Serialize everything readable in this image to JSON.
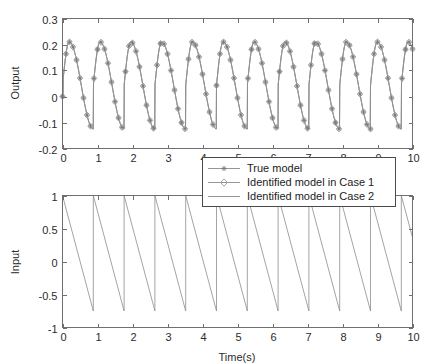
{
  "figure": {
    "background": "#ffffff",
    "axis_color": "#6f6f6f",
    "line_color": "#8a8a8a"
  },
  "legend": {
    "position": "between-axes-center",
    "items": [
      {
        "label": "True model",
        "marker": "asterisk-marker",
        "color": "#8a8a8a"
      },
      {
        "label": "Identified model in Case 1",
        "marker": "diamond-marker",
        "color": "#9d9d9d"
      },
      {
        "label": "Identified model in Case 2",
        "marker": "line-only",
        "color": "#8a8a8a"
      }
    ]
  },
  "chart_data": [
    {
      "type": "line",
      "id": "output-plot",
      "title": "",
      "xlabel": "",
      "ylabel": "Output",
      "xlim": [
        0,
        10
      ],
      "ylim": [
        -0.2,
        0.3
      ],
      "xticks": [
        0,
        1,
        2,
        3,
        4,
        5,
        6,
        7,
        8,
        9,
        10
      ],
      "xticklabels": [
        "0",
        "1",
        "2",
        "3",
        "4",
        "5",
        "6",
        "7",
        "8",
        "9",
        "10"
      ],
      "yticks": [
        -0.2,
        -0.1,
        0,
        0.1,
        0.2,
        0.3
      ],
      "yticklabels": [
        "-0.2",
        "-0.1",
        "0",
        "0.1",
        "0.2",
        "0.3"
      ],
      "grid": false,
      "legend_position": "outside-below-center",
      "waveform": {
        "shape": "periodic-sawtooth-response",
        "period": 0.88,
        "peak": 0.21,
        "trough": -0.125,
        "sample_interval": 0.1,
        "description": "Periodic output response to sawtooth input; rises to about 0.21 then falls to about -0.125 each cycle"
      },
      "series": [
        {
          "name": "True model",
          "marker": "asterisk-marker",
          "color": "#8a8a8a"
        },
        {
          "name": "Identified model in Case 1",
          "marker": "diamond-marker",
          "color": "#9d9d9d"
        },
        {
          "name": "Identified model in Case 2",
          "marker": "line-only",
          "color": "#8a8a8a"
        }
      ]
    },
    {
      "type": "line",
      "id": "input-plot",
      "title": "",
      "xlabel": "Time(s)",
      "ylabel": "Input",
      "xlim": [
        0,
        10
      ],
      "ylim": [
        -1,
        1
      ],
      "xticks": [
        0,
        1,
        2,
        3,
        4,
        5,
        6,
        7,
        8,
        9,
        10
      ],
      "xticklabels": [
        "0",
        "1",
        "2",
        "3",
        "4",
        "5",
        "6",
        "7",
        "8",
        "9",
        "10"
      ],
      "yticks": [
        -1,
        -0.5,
        0,
        0.5,
        1
      ],
      "yticklabels": [
        "-1",
        "-0.5",
        "0",
        "0.5",
        "1"
      ],
      "grid": false,
      "waveform": {
        "shape": "sawtooth",
        "period": 0.88,
        "high": 1.0,
        "low": -0.75,
        "description": "Descending sawtooth from 1 to about -0.75 each period, then instant reset to 1"
      }
    }
  ]
}
